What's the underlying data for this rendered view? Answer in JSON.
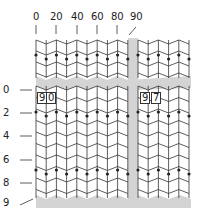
{
  "diagram": {
    "top_axis": {
      "labels": [
        "0",
        "20",
        "40",
        "60",
        "80",
        "90"
      ],
      "x_positions": [
        36,
        56,
        77,
        97,
        117,
        136
      ]
    },
    "left_axis": {
      "labels": [
        "0",
        "2",
        "4",
        "6",
        "8",
        "9"
      ],
      "y_positions": [
        90,
        113,
        136,
        160,
        183,
        203
      ]
    },
    "boxed_labels": [
      {
        "text": "9",
        "x": 37,
        "y": 92
      },
      {
        "text": "0",
        "x": 46,
        "y": 92
      },
      {
        "text": "9",
        "x": 140,
        "y": 92
      },
      {
        "text": "7",
        "x": 151,
        "y": 92
      }
    ],
    "colors": {
      "line": "#333333",
      "dot": "#222222",
      "shade": "#d4d4d4",
      "background": "#ffffff"
    },
    "panels": {
      "upper_left": {
        "x0": 36,
        "x1": 128,
        "y0": 40,
        "y1": 78
      },
      "upper_right": {
        "x0": 138,
        "x1": 191,
        "y0": 40,
        "y1": 78
      },
      "lower_left": {
        "x0": 36,
        "x1": 128,
        "y0": 86,
        "y1": 198
      },
      "lower_right": {
        "x0": 138,
        "x1": 191,
        "y0": 86,
        "y1": 198
      }
    },
    "dot_rows": [
      55,
      112,
      170
    ]
  }
}
